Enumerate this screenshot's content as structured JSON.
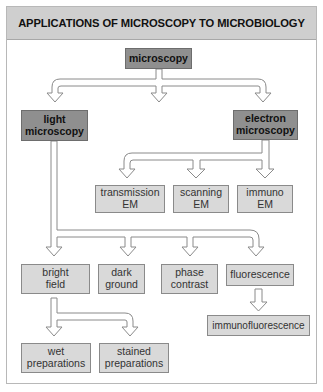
{
  "title": "APPLICATIONS OF MICROSCOPY TO MICROBIOLOGY",
  "colors": {
    "header_bg": "#cfcfcf",
    "primary_box": "#8f8f8f",
    "secondary_box": "#d9d9d9",
    "frame_border": "#b8b8b8",
    "arrow_stroke": "#8a8a8a"
  },
  "nodes": {
    "root": {
      "label": "microscopy"
    },
    "light": {
      "line1": "light",
      "line2": "microscopy"
    },
    "electron": {
      "line1": "electron",
      "line2": "microscopy"
    },
    "transmission_em": {
      "line1": "transmission",
      "line2": "EM"
    },
    "scanning_em": {
      "line1": "scanning",
      "line2": "EM"
    },
    "immuno_em": {
      "line1": "immuno",
      "line2": "EM"
    },
    "bright_field": {
      "line1": "bright",
      "line2": "field"
    },
    "dark_ground": {
      "line1": "dark",
      "line2": "ground"
    },
    "phase_contrast": {
      "line1": "phase",
      "line2": "contrast"
    },
    "fluorescence": {
      "label": "fluorescence"
    },
    "immunofluorescence": {
      "label": "immunofluorescence"
    },
    "wet_preparations": {
      "line1": "wet",
      "line2": "preparations"
    },
    "stained_preparations": {
      "line1": "stained",
      "line2": "preparations"
    }
  },
  "edges": [
    [
      "microscopy",
      "light microscopy"
    ],
    [
      "microscopy",
      "(unlabeled middle)"
    ],
    [
      "microscopy",
      "electron microscopy"
    ],
    [
      "electron microscopy",
      "transmission EM"
    ],
    [
      "electron microscopy",
      "scanning EM"
    ],
    [
      "electron microscopy",
      "immuno EM"
    ],
    [
      "light microscopy",
      "bright field"
    ],
    [
      "light microscopy",
      "dark ground"
    ],
    [
      "light microscopy",
      "phase contrast"
    ],
    [
      "light microscopy",
      "fluorescence"
    ],
    [
      "fluorescence",
      "immunofluorescence"
    ],
    [
      "bright field",
      "wet preparations"
    ],
    [
      "bright field",
      "stained preparations"
    ]
  ]
}
